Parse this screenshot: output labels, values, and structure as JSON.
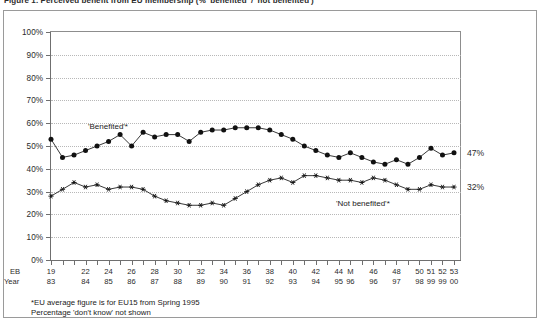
{
  "title": "Figure 1. Perceived benefit from EU membership (% 'benefited' / 'not benefited')",
  "axis": {
    "y_ticks": [
      "0%",
      "10%",
      "20%",
      "30%",
      "40%",
      "50%",
      "60%",
      "70%",
      "80%",
      "90%",
      "100%"
    ],
    "y_min": 0,
    "y_max": 100,
    "row_labels": {
      "eb": "EB",
      "year": "Year"
    }
  },
  "series_labels": {
    "benefited": "'Benefited'*",
    "not_benefited": "'Not benefited'*"
  },
  "end_values": {
    "benefited": "47%",
    "not_benefited": "32%"
  },
  "footnotes": {
    "line1": "*EU average figure is for EU15 from Spring 1995",
    "line2": "Percentage 'don't know' not shown"
  },
  "chart_data": {
    "type": "line",
    "title": "Perceived benefit from EU membership",
    "xlabel": "",
    "ylabel": "",
    "ylim": [
      0,
      100
    ],
    "grid": true,
    "legend": "inline-annotations",
    "categories": [
      "19",
      "20",
      "21",
      "22",
      "23",
      "24",
      "25",
      "26",
      "27",
      "28",
      "29",
      "30",
      "31",
      "32",
      "33",
      "34",
      "35",
      "36",
      "37",
      "38",
      "39",
      "40",
      "41",
      "42",
      "43",
      "44",
      "M",
      "45",
      "46",
      "47",
      "48",
      "49",
      "50",
      "51",
      "52",
      "53"
    ],
    "x_labels_eb": [
      "19",
      "",
      "",
      "22",
      "",
      "24",
      "",
      "26",
      "",
      "28",
      "",
      "30",
      "",
      "32",
      "",
      "34",
      "",
      "36",
      "",
      "38",
      "",
      "40",
      "",
      "42",
      "",
      "44",
      "M",
      "",
      "46",
      "",
      "48",
      "",
      "50",
      "51",
      "52",
      "53"
    ],
    "x_labels_year": [
      "83",
      "",
      "",
      "84",
      "",
      "85",
      "",
      "86",
      "",
      "87",
      "",
      "88",
      "",
      "89",
      "",
      "90",
      "",
      "91",
      "",
      "92",
      "",
      "93",
      "",
      "94",
      "",
      "95",
      "96",
      "",
      "96",
      "",
      "97",
      "",
      "98",
      "99",
      "99",
      "00"
    ],
    "series": [
      {
        "name": "'Benefited'*",
        "marker": "filled-circle",
        "values": [
          53,
          45,
          46,
          48,
          50,
          52,
          55,
          50,
          56,
          54,
          55,
          55,
          52,
          56,
          57,
          57,
          58,
          58,
          58,
          57,
          55,
          53,
          50,
          48,
          46,
          45,
          47,
          45,
          43,
          42,
          44,
          42,
          45,
          49,
          46,
          47
        ]
      },
      {
        "name": "'Not benefited'*",
        "marker": "star",
        "values": [
          28,
          31,
          34,
          32,
          33,
          31,
          32,
          32,
          31,
          28,
          26,
          25,
          24,
          24,
          25,
          24,
          27,
          30,
          33,
          35,
          36,
          34,
          37,
          37,
          36,
          35,
          35,
          34,
          36,
          35,
          33,
          31,
          31,
          33,
          32,
          32
        ]
      }
    ]
  }
}
